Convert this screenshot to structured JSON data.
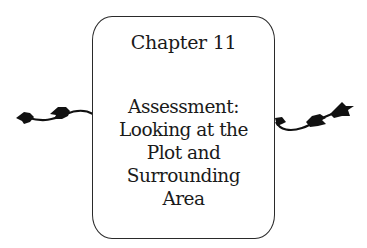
{
  "card": {
    "chapter_label": "Chapter 11",
    "title_lines": [
      "Assessment:",
      "Looking at the",
      "Plot and",
      "Surrounding",
      "Area"
    ]
  },
  "decorations": {
    "left": "vine-ornament",
    "right": "vine-ornament"
  },
  "colors": {
    "ink": "#1a1a1a",
    "background": "#ffffff"
  }
}
